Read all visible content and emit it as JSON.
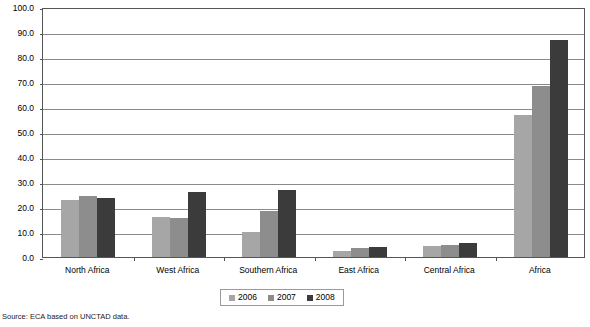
{
  "chart_data": {
    "type": "bar",
    "title": "",
    "subtitle": "",
    "xlabel": "",
    "ylabel": "",
    "ylim": [
      0,
      100
    ],
    "ytick_step": 10,
    "ytick_labels": [
      "0.0",
      "10.0",
      "20.0",
      "30.0",
      "40.0",
      "50.0",
      "60.0",
      "70.0",
      "80.0",
      "90.0",
      "100.0"
    ],
    "ytick_values": [
      0,
      10,
      20,
      30,
      40,
      50,
      60,
      70,
      80,
      90,
      100
    ],
    "grid": true,
    "legend_position": "bottom",
    "categories": [
      "North Africa",
      "West Africa",
      "Southern Africa",
      "East Africa",
      "Central Africa",
      "Africa"
    ],
    "series": [
      {
        "name": "2006",
        "color": "#a6a6a6",
        "values": [
          23.0,
          16.2,
          10.2,
          2.6,
          4.4,
          56.8
        ]
      },
      {
        "name": "2007",
        "color": "#8d8d8d",
        "values": [
          24.6,
          15.6,
          18.6,
          3.6,
          5.0,
          68.6
        ]
      },
      {
        "name": "2008",
        "color": "#3b3b3b",
        "values": [
          23.7,
          25.9,
          27.0,
          4.0,
          5.8,
          87.0
        ]
      }
    ],
    "annotations": [],
    "source": "Source: ECA based on UNCTAD data."
  },
  "legend": {
    "entries": [
      {
        "label": "2006"
      },
      {
        "label": "2007"
      },
      {
        "label": "2008"
      }
    ]
  },
  "colors": {
    "series_2006": "#a6a6a6",
    "series_2007": "#8d8d8d",
    "series_2008": "#3b3b3b",
    "gridline": "#8a8a8a",
    "axis": "#555555",
    "background": "#ffffff"
  },
  "source_note": "Source: ECA based on UNCTAD data."
}
